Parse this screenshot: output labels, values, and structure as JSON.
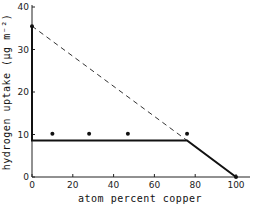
{
  "chart_data": {
    "type": "line",
    "title": "",
    "xlabel": "atom percent copper",
    "ylabel": "hydrogen uptake (μg m⁻²)",
    "xlim": [
      0,
      100
    ],
    "ylim": [
      0,
      40
    ],
    "xticks": [
      "0",
      "20",
      "40",
      "60",
      "80",
      "100"
    ],
    "yticks": [
      "0",
      "10",
      "20",
      "30",
      "40"
    ],
    "grid": false,
    "legend": null,
    "series": [
      {
        "name": "measured points",
        "style": "markers",
        "x": [
          0,
          10,
          28,
          47,
          76,
          100
        ],
        "y": [
          35.5,
          10.2,
          10.2,
          10.2,
          10.2,
          0
        ]
      },
      {
        "name": "solid line",
        "style": "solid",
        "x": [
          0,
          0,
          76,
          100
        ],
        "y": [
          35.5,
          8.6,
          8.6,
          0
        ]
      },
      {
        "name": "dashed line",
        "style": "dashed",
        "x": [
          0,
          76
        ],
        "y": [
          35.5,
          8.6
        ]
      }
    ]
  }
}
